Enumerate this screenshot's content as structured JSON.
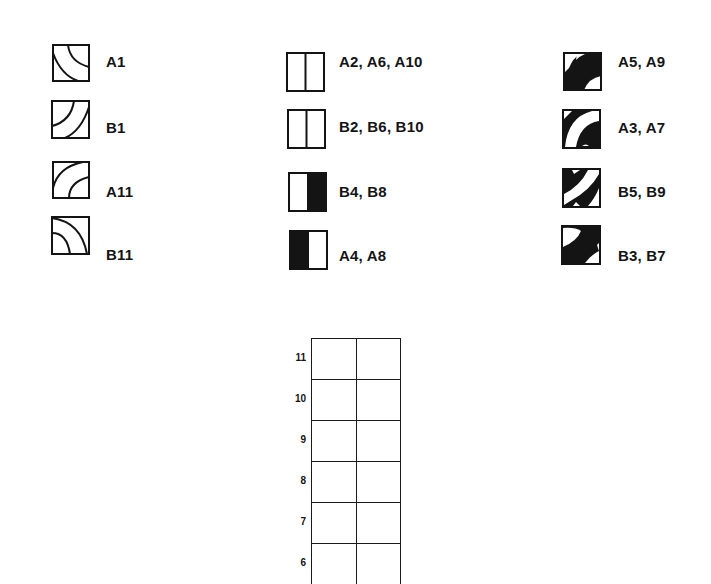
{
  "legend": {
    "column_1": [
      {
        "id": "A1",
        "label": "A1",
        "icon": "quarter-arcs-top-right-and-bottom-left-icon"
      },
      {
        "id": "B1",
        "label": "B1",
        "icon": "quarter-arcs-bottom-left-diagonal-icon"
      },
      {
        "id": "A11",
        "label": "A11",
        "icon": "quarter-arcs-bottom-right-icon"
      },
      {
        "id": "B11",
        "label": "B11",
        "icon": "quarter-arcs-bottom-left-corner-icon"
      }
    ],
    "column_2": [
      {
        "id": "A2",
        "label": "A2, A6, A10",
        "icon": "split-square-outline-icon"
      },
      {
        "id": "B2",
        "label": "B2, B6, B10",
        "icon": "split-square-outline-icon"
      },
      {
        "id": "B4",
        "label": "B4, B8",
        "icon": "split-square-right-filled-icon"
      },
      {
        "id": "A4",
        "label": "A4, A8",
        "icon": "split-square-left-filled-icon"
      }
    ],
    "column_3": [
      {
        "id": "A5",
        "label": "A5, A9",
        "icon": "filled-arc-band-icon"
      },
      {
        "id": "A3",
        "label": "A3, A7",
        "icon": "white-arc-band-on-black-icon"
      },
      {
        "id": "B5",
        "label": "B5, B9",
        "icon": "white-diagonal-band-on-black-icon"
      },
      {
        "id": "B3",
        "label": "B3, B7",
        "icon": "black-arc-band-white-corners-icon"
      }
    ]
  },
  "grid": {
    "columns": 2,
    "rows": [
      {
        "label": "11"
      },
      {
        "label": "10"
      },
      {
        "label": "9"
      },
      {
        "label": "8"
      },
      {
        "label": "7"
      },
      {
        "label": "6"
      }
    ]
  },
  "colors": {
    "ink": "#141414",
    "paper": "#ffffff"
  }
}
